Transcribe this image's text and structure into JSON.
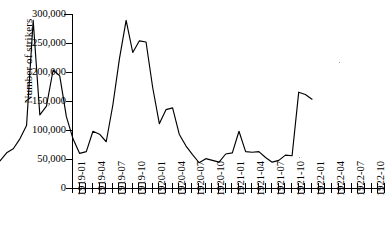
{
  "axes": {
    "y_title": "Number of strikers",
    "y_ticks": [
      "300,000",
      "250,000",
      "200,000",
      "150,000",
      "100,000",
      "50,000",
      "0"
    ],
    "x_ticks_shown": [
      "1919-01",
      "1919-04",
      "1919-07",
      "1919-10",
      "1920-01",
      "1920-04",
      "1920-07",
      "1920-10",
      "1921-01",
      "1921-04",
      "1921-07",
      "1921-10",
      "1922-01",
      "1922-04",
      "1922-07",
      "1922-10"
    ]
  },
  "chart_data": {
    "type": "line",
    "title": "",
    "subtitle": "",
    "xlabel": "",
    "ylabel": "Number of strikers",
    "ylim": [
      0,
      300000
    ],
    "ytick_values": [
      0,
      50000,
      100000,
      150000,
      200000,
      250000,
      300000
    ],
    "grid": false,
    "legend": null,
    "legend_position": "none",
    "line_color": "#000000",
    "x": [
      "1919-01",
      "1919-02",
      "1919-03",
      "1919-04",
      "1919-05",
      "1919-06",
      "1919-07",
      "1919-08",
      "1919-09",
      "1919-10",
      "1919-11",
      "1919-12",
      "1920-01",
      "1920-02",
      "1920-03",
      "1920-04",
      "1920-05",
      "1920-06",
      "1920-07",
      "1920-08",
      "1920-09",
      "1920-10",
      "1920-11",
      "1920-12",
      "1921-01",
      "1921-02",
      "1921-03",
      "1921-04",
      "1921-05",
      "1921-06",
      "1921-07",
      "1921-08",
      "1921-09",
      "1921-10",
      "1921-11",
      "1921-12",
      "1922-01",
      "1922-02",
      "1922-03",
      "1922-04",
      "1922-05",
      "1922-06",
      "1922-07",
      "1922-08",
      "1922-09",
      "1922-10",
      "1922-11",
      "1922-12"
    ],
    "series": [
      {
        "name": "Number of strikers",
        "values": [
          24000,
          38000,
          45000,
          62000,
          85000,
          265000,
          103000,
          118000,
          180000,
          170000,
          100000,
          62000,
          37000,
          40000,
          75000,
          70000,
          57000,
          120000,
          200000,
          265000,
          210000,
          230000,
          228000,
          150000,
          88000,
          112000,
          115000,
          70000,
          50000,
          35000,
          21000,
          28000,
          25000,
          22000,
          36000,
          38000,
          75000,
          40000,
          39000,
          40000,
          30000,
          22000,
          25000,
          34000,
          33000,
          142000,
          138000,
          130000
        ]
      }
    ],
    "annotations": []
  },
  "plot_points_px": {
    "comment": "Polyline vertex coordinates within the 312x175 plot area, left=0 top=0, y=0 is 300,000 and y=175 is 0.",
    "points": "0,174 6.5,166 13,162 19.5,156 26,140 32.5,35 39,130 45.5,120 52,85 58.5,86 65,130 71.5,156 78,167 84.5,145 91,131 97.5,144 104,157 110.5,130 117,86 123.5,33 130,53 136.5,42 143,44 149.5,86 156,123 162.5,111 169,110 175.5,134 182,144 188.5,151 195,162 201.5,157 208,159 214.5,161 221,155 227.5,153 234,131 240.5,152 247,153 253.5,152 260,157 266.5,161 273,158 279.5,155 286,141 292.5,93 299,94 305.5,98 312,116"
  },
  "curve_px_full": {
    "comment": "Full 48-vertex path in plot-area pixels matching the rendered trace.",
    "d": "M 0,174 L 5,172 L 10,165 L 15,162 L 20,155 L 26,140 L 32,35 L 38,128 L 44,119 L 50,84 L 56,86 L 62,130 L 68,153 L 74,167 L 80,166 L 86,145 L 92,131 L 98,144 L 104,142 L 110,110 L 116,85 L 122,33 L 128,54 L 133,42 L 139,44 L 145,63 L 151,108 L 157,121 L 163,112 L 169,110 L 175,132 L 181,145 L 187,151 L 193,162 L 199,158 L 205,162 L 211,159 L 217,155 L 223,154 L 229,132 L 235,131 L 241,152 L 247,153 L 253,152 L 259,156 L 265,161 L 271,158 L 277,157 L 283,145 L 289,94 L 295,93 L 301,97 L 307,100 L 312,116"
  }
}
